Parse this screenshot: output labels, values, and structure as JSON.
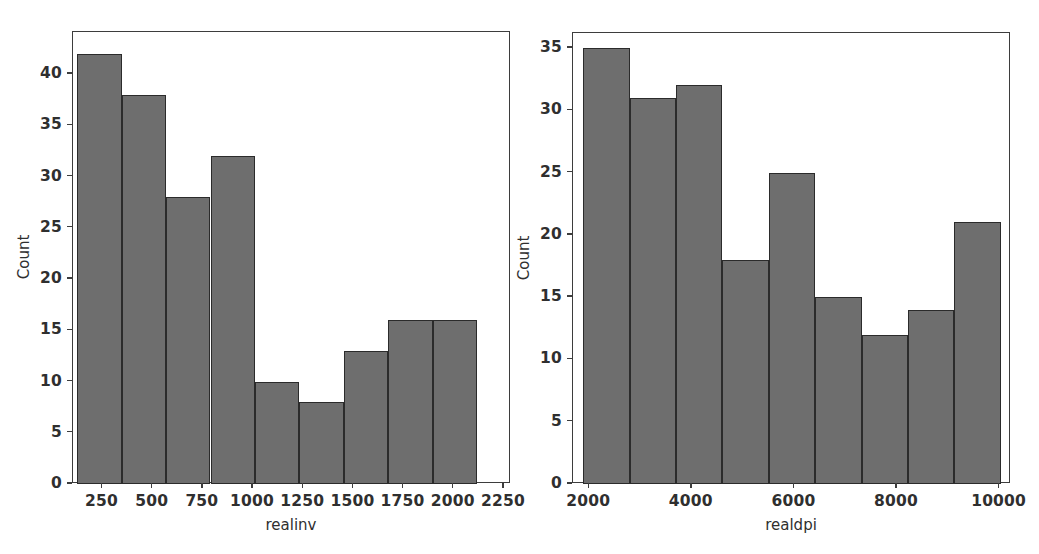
{
  "figure": {
    "width": 1039,
    "height": 554,
    "background": "#ffffff",
    "bar_fill": "#6e6e6e",
    "bar_edge": "#2b2b2b",
    "axis_color": "#3d3d3d",
    "text_color": "#2f2f2f"
  },
  "chart_data": [
    {
      "type": "bar",
      "title": "",
      "xlabel": "realinv",
      "ylabel": "Count",
      "categories": [
        "125-346",
        "346-567",
        "567-788",
        "788-1010",
        "1010-1231",
        "1231-1452",
        "1452-1673",
        "1673-1894",
        "1894-2116"
      ],
      "bin_edges": [
        125,
        346,
        567,
        788,
        1010,
        1231,
        1452,
        1673,
        1894,
        2116
      ],
      "values": [
        42,
        38,
        28,
        32,
        10,
        8,
        13,
        16,
        16
      ],
      "xticks": [
        250,
        500,
        750,
        1000,
        1250,
        1500,
        1750,
        2000,
        2250
      ],
      "xticklabels": [
        "250",
        "500",
        "750",
        "1000",
        "1250",
        "1500",
        "1750",
        "2000",
        "2250"
      ],
      "yticks": [
        0,
        5,
        10,
        15,
        20,
        25,
        30,
        35,
        40
      ],
      "yticklabels": [
        "0",
        "5",
        "10",
        "15",
        "20",
        "25",
        "30",
        "35",
        "40"
      ],
      "xlim": [
        103,
        2285
      ],
      "ylim": [
        0,
        44.1
      ],
      "grid": false,
      "legend": null
    },
    {
      "type": "bar",
      "title": "",
      "xlabel": "realdpi",
      "ylabel": "Count",
      "categories": [
        "1886-2790",
        "2790-3694",
        "3694-4598",
        "4598-5502",
        "5502-6406",
        "6406-7310",
        "7310-8214",
        "8214-9118",
        "9118-10022"
      ],
      "bin_edges": [
        1886,
        2790,
        3694,
        4598,
        5502,
        6406,
        7310,
        8214,
        9118,
        10022
      ],
      "values": [
        35,
        31,
        32,
        18,
        25,
        15,
        12,
        14,
        21
      ],
      "xticks": [
        2000,
        4000,
        6000,
        8000,
        10000
      ],
      "xticklabels": [
        "2000",
        "4000",
        "6000",
        "8000",
        "10000"
      ],
      "yticks": [
        0,
        5,
        10,
        15,
        20,
        25,
        30,
        35
      ],
      "yticklabels": [
        "0",
        "5",
        "10",
        "15",
        "20",
        "25",
        "30",
        "35"
      ],
      "xlim": [
        1684,
        10222
      ],
      "ylim": [
        0,
        36.2
      ],
      "grid": false,
      "legend": null
    }
  ]
}
